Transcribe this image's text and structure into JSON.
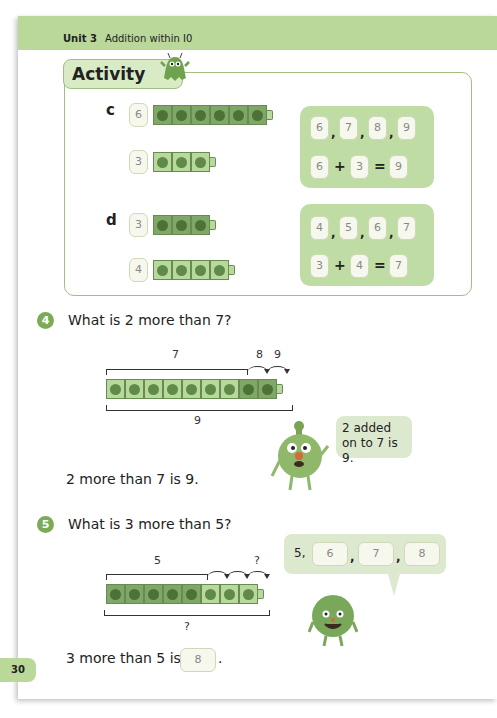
{
  "header": {
    "unit": "Unit 3",
    "title": "Addition within I0"
  },
  "activity": {
    "tab_label": "Activity",
    "parts": [
      {
        "letter": "c",
        "rows": [
          {
            "count": "6",
            "cubes": 6
          },
          {
            "count": "3",
            "cubes": 3
          }
        ],
        "sequence": [
          "6",
          "7",
          "8",
          "9"
        ],
        "equation": {
          "a": "6",
          "op": "+",
          "b": "3",
          "eq": "=",
          "result": "9"
        }
      },
      {
        "letter": "d",
        "rows": [
          {
            "count": "3",
            "cubes": 3
          },
          {
            "count": "4",
            "cubes": 4
          }
        ],
        "sequence": [
          "4",
          "5",
          "6",
          "7"
        ],
        "equation": {
          "a": "3",
          "op": "+",
          "b": "4",
          "eq": "=",
          "result": "7"
        }
      }
    ]
  },
  "q4": {
    "number": "4",
    "question": "What is 2 more than 7?",
    "top_label": "7",
    "step_labels": [
      "8",
      "9"
    ],
    "bottom_label": "9",
    "answer_text": "2 more than 7 is 9.",
    "speech": "2 added on to 7 is 9."
  },
  "q5": {
    "number": "5",
    "question": "What is 3 more than 5?",
    "top_label": "5",
    "step_label": "?",
    "bottom_label": "?",
    "answer_prefix": "3 more than 5 is",
    "answer_value": "8",
    "answer_suffix": ".",
    "speech_prefix": "5,",
    "speech_sequence": [
      "6",
      "7",
      "8"
    ]
  },
  "footer": {
    "page_number": "30"
  },
  "colors": {
    "header": "#b9d89a",
    "cube_dark": "#7fa866",
    "cube_light": "#b8d99c",
    "badge": "#7cab58"
  }
}
